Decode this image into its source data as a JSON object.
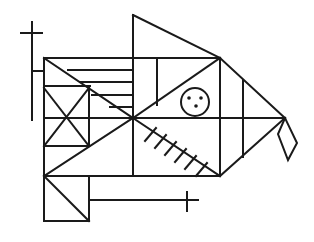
{
  "diagram": {
    "title": "",
    "stroke_color": "#1a1a1a",
    "background": "#ffffff",
    "elements": {
      "top_plus_sign": "plus",
      "eye_circle": "circle with three dots",
      "gill_slashes": 6,
      "mouth_diamond": "diamond",
      "bottom_plus_sign": "plus"
    }
  }
}
